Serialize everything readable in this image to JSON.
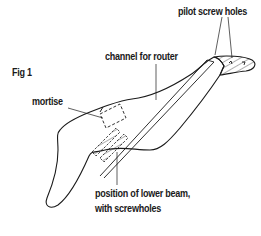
{
  "figure": {
    "title": "Fig 1",
    "labels": {
      "pilot_screw_holes": "pilot screw holes",
      "channel_for_router": "channel for router",
      "mortise": "mortise",
      "lower_beam_line1": "position of lower beam,",
      "lower_beam_line2": "with screwholes"
    },
    "colors": {
      "ink": "#1a1a1a",
      "background": "#ffffff"
    }
  }
}
